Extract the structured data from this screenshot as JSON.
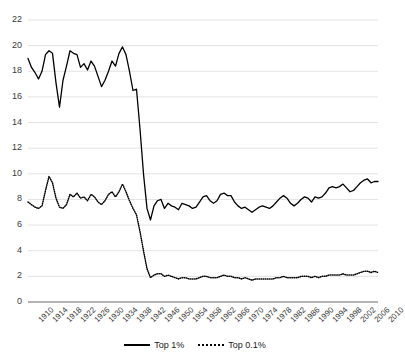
{
  "chart_data": {
    "type": "line",
    "title": "",
    "xlabel": "",
    "ylabel": "",
    "xlim": [
      1910,
      2010
    ],
    "ylim": [
      0,
      22
    ],
    "ytick_step": 2,
    "xtick_step": 4,
    "grid": true,
    "legend_position": "bottom-center",
    "yticks": [
      "0",
      "2",
      "4",
      "6",
      "8",
      "10",
      "12",
      "14",
      "16",
      "18",
      "20",
      "22"
    ],
    "xticks": [
      "1910",
      "1914",
      "1918",
      "1922",
      "1926",
      "1930",
      "1934",
      "1938",
      "1942",
      "1946",
      "1950",
      "1954",
      "1958",
      "1962",
      "1966",
      "1970",
      "1974",
      "1978",
      "1982",
      "1986",
      "1990",
      "1994",
      "1998",
      "2002",
      "2006",
      "2010"
    ],
    "x": [
      1910,
      1911,
      1912,
      1913,
      1914,
      1915,
      1916,
      1917,
      1918,
      1919,
      1920,
      1921,
      1922,
      1923,
      1924,
      1925,
      1926,
      1927,
      1928,
      1929,
      1930,
      1931,
      1932,
      1933,
      1934,
      1935,
      1936,
      1937,
      1938,
      1939,
      1940,
      1941,
      1942,
      1943,
      1944,
      1945,
      1946,
      1947,
      1948,
      1949,
      1950,
      1951,
      1952,
      1953,
      1954,
      1955,
      1956,
      1957,
      1958,
      1959,
      1960,
      1961,
      1962,
      1963,
      1964,
      1965,
      1966,
      1967,
      1968,
      1969,
      1970,
      1971,
      1972,
      1973,
      1974,
      1975,
      1976,
      1977,
      1978,
      1979,
      1980,
      1981,
      1982,
      1983,
      1984,
      1985,
      1986,
      1987,
      1988,
      1989,
      1990,
      1991,
      1992,
      1993,
      1994,
      1995,
      1996,
      1997,
      1998,
      1999,
      2000,
      2001,
      2002,
      2003,
      2004,
      2005,
      2006,
      2007,
      2008,
      2009,
      2010
    ],
    "series": [
      {
        "name": "Top 1%",
        "style": "solid",
        "color": "#000000",
        "values": [
          19.0,
          18.3,
          17.9,
          17.4,
          18.0,
          19.3,
          19.6,
          19.4,
          17.1,
          15.2,
          17.3,
          18.4,
          19.6,
          19.4,
          19.3,
          18.3,
          18.6,
          18.1,
          18.8,
          18.4,
          17.6,
          16.8,
          17.3,
          18.0,
          18.8,
          18.4,
          19.4,
          19.9,
          19.3,
          18.0,
          16.5,
          16.6,
          13.5,
          10.0,
          7.3,
          6.4,
          7.5,
          7.9,
          8.0,
          7.3,
          7.7,
          7.5,
          7.4,
          7.2,
          7.7,
          7.6,
          7.5,
          7.3,
          7.4,
          7.8,
          8.2,
          8.3,
          7.9,
          7.7,
          7.9,
          8.4,
          8.5,
          8.3,
          8.3,
          7.8,
          7.5,
          7.3,
          7.4,
          7.2,
          7.0,
          7.2,
          7.4,
          7.5,
          7.4,
          7.3,
          7.5,
          7.8,
          8.1,
          8.3,
          8.1,
          7.7,
          7.5,
          7.7,
          8.0,
          8.2,
          8.1,
          7.8,
          8.2,
          8.1,
          8.2,
          8.5,
          8.9,
          9.0,
          8.9,
          9.0,
          9.2,
          8.9,
          8.6,
          8.7,
          9.0,
          9.3,
          9.5,
          9.6,
          9.3,
          9.4,
          9.4
        ]
      },
      {
        "name": "Top 0.1%",
        "style": "dotted",
        "color": "#000000",
        "values": [
          7.8,
          7.6,
          7.4,
          7.3,
          7.5,
          8.7,
          9.8,
          9.3,
          8.1,
          7.4,
          7.3,
          7.6,
          8.4,
          8.2,
          8.5,
          8.1,
          8.2,
          7.9,
          8.4,
          8.2,
          7.8,
          7.6,
          7.9,
          8.4,
          8.6,
          8.2,
          8.6,
          9.2,
          8.6,
          7.9,
          7.3,
          6.8,
          5.5,
          4.0,
          2.6,
          1.9,
          2.1,
          2.2,
          2.2,
          2.0,
          2.1,
          2.0,
          1.9,
          1.8,
          1.9,
          1.9,
          1.8,
          1.8,
          1.8,
          1.9,
          2.0,
          2.0,
          1.9,
          1.9,
          1.9,
          2.0,
          2.1,
          2.0,
          2.0,
          1.9,
          1.9,
          1.8,
          1.9,
          1.8,
          1.7,
          1.8,
          1.8,
          1.8,
          1.8,
          1.8,
          1.8,
          1.9,
          1.9,
          2.0,
          1.9,
          1.9,
          1.9,
          1.9,
          2.0,
          2.0,
          2.0,
          1.9,
          2.0,
          1.9,
          2.0,
          2.0,
          2.1,
          2.1,
          2.1,
          2.1,
          2.2,
          2.1,
          2.1,
          2.1,
          2.2,
          2.3,
          2.4,
          2.4,
          2.3,
          2.4,
          2.3
        ]
      }
    ]
  },
  "legend": {
    "items": [
      {
        "label": "Top 1%",
        "style": "solid"
      },
      {
        "label": "Top 0.1%",
        "style": "dotted"
      }
    ]
  },
  "colors": {
    "line": "#000000",
    "grid": "#e3e3e3",
    "axis": "#9a9a9a",
    "tick_text": "#3a3a3a",
    "background": "#ffffff"
  }
}
